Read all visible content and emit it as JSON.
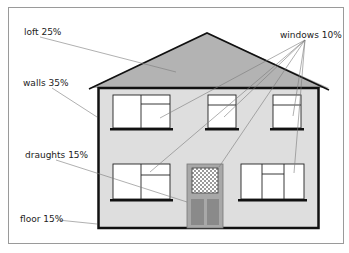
{
  "diagram": {
    "type": "house-heat-loss",
    "labels": {
      "loft": "loft 25%",
      "windows": "windows 10%",
      "walls": "walls 35%",
      "draughts": "draughts 15%",
      "floor": "floor 15%"
    },
    "segments": [
      {
        "name": "loft",
        "percent": 25
      },
      {
        "name": "walls",
        "percent": 35
      },
      {
        "name": "windows",
        "percent": 10
      },
      {
        "name": "draughts",
        "percent": 15
      },
      {
        "name": "floor",
        "percent": 15
      }
    ],
    "colors": {
      "roof": "#b3b3b3",
      "wall": "#dedede",
      "outline": "#111111",
      "leader": "#7a7a7a",
      "door": "#a8a8a8",
      "door_panel": "#8a8a8a",
      "frame": "#9a9a9a"
    }
  }
}
